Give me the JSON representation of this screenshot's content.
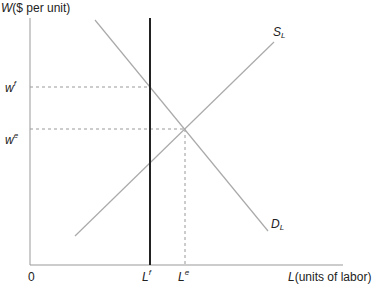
{
  "y_axis": {
    "label_var": "W",
    "label_rest": "($ per unit)"
  },
  "x_axis": {
    "label_var": "L",
    "label_rest": "(units of labor)",
    "origin": "0"
  },
  "ticks_y": [
    {
      "base": "w",
      "sup": "f"
    },
    {
      "base": "w",
      "sup": "e"
    }
  ],
  "ticks_x": [
    {
      "base": "L",
      "sup": "f"
    },
    {
      "base": "L",
      "sup": "e"
    }
  ],
  "curves": {
    "supply": {
      "base": "S",
      "sub": "L"
    },
    "demand": {
      "base": "D",
      "sub": "L"
    }
  },
  "colors": {
    "axis": "#999999",
    "curve": "#aaaaaa",
    "bold_line": "#222222",
    "dash": "#999999"
  }
}
